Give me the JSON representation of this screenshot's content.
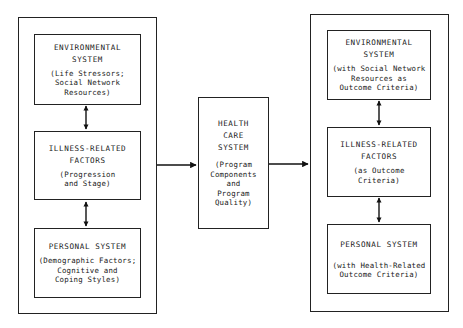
{
  "diagram": {
    "left_group": {
      "boxes": [
        {
          "title": "ENVIRONMENTAL\nSYSTEM",
          "subtitle": "(Life Stressors;\nSocial Network\nResources)"
        },
        {
          "title": "ILLNESS-RELATED\nFACTORS",
          "subtitle": "(Progression\nand Stage)"
        },
        {
          "title": "PERSONAL SYSTEM",
          "subtitle": "(Demographic Factors;\nCognitive and\nCoping Styles)"
        }
      ]
    },
    "center": {
      "title": "HEALTH\nCARE\nSYSTEM",
      "subtitle": "(Program\nComponents\nand\nProgram\nQuality)"
    },
    "right_group": {
      "boxes": [
        {
          "title": "ENVIRONMENTAL\nSYSTEM",
          "subtitle": "(with Social Network\nResources as\nOutcome Criteria)"
        },
        {
          "title": "ILLNESS-RELATED\nFACTORS",
          "subtitle": "(as Outcome\nCriteria)"
        },
        {
          "title": "PERSONAL SYSTEM",
          "subtitle": "(with Health-Related\nOutcome Criteria)"
        }
      ]
    },
    "connections": [
      {
        "from": "left-environmental",
        "to": "left-illness",
        "type": "bidirectional"
      },
      {
        "from": "left-illness",
        "to": "left-personal",
        "type": "bidirectional"
      },
      {
        "from": "left-group",
        "to": "health-care-system",
        "type": "directed"
      },
      {
        "from": "health-care-system",
        "to": "right-group",
        "type": "directed"
      },
      {
        "from": "right-environmental",
        "to": "right-illness",
        "type": "bidirectional"
      },
      {
        "from": "right-illness",
        "to": "right-personal",
        "type": "bidirectional"
      }
    ]
  }
}
